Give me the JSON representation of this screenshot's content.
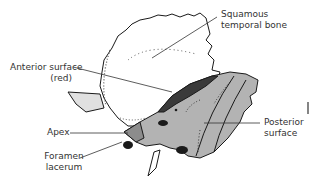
{
  "diagram": {
    "subject": "Temporal bone",
    "labels": {
      "squamous_line1": "Squamous",
      "squamous_line2": "temporal bone",
      "anterior_line1": "Anterior surface",
      "anterior_line2": "(red)",
      "apex": "Apex",
      "foramen_line1": "Foramen",
      "foramen_line2": "lacerum",
      "posterior_line1": "Posterior",
      "posterior_line2": "surface"
    },
    "colors": {
      "outline": "#1a1a1a",
      "petrous_grey": "#b3b3b3",
      "anterior_surface_dark": "#3a3a3a",
      "apex_grey": "#8c8c8c",
      "leader_line": "#333333",
      "text": "#333333"
    }
  }
}
